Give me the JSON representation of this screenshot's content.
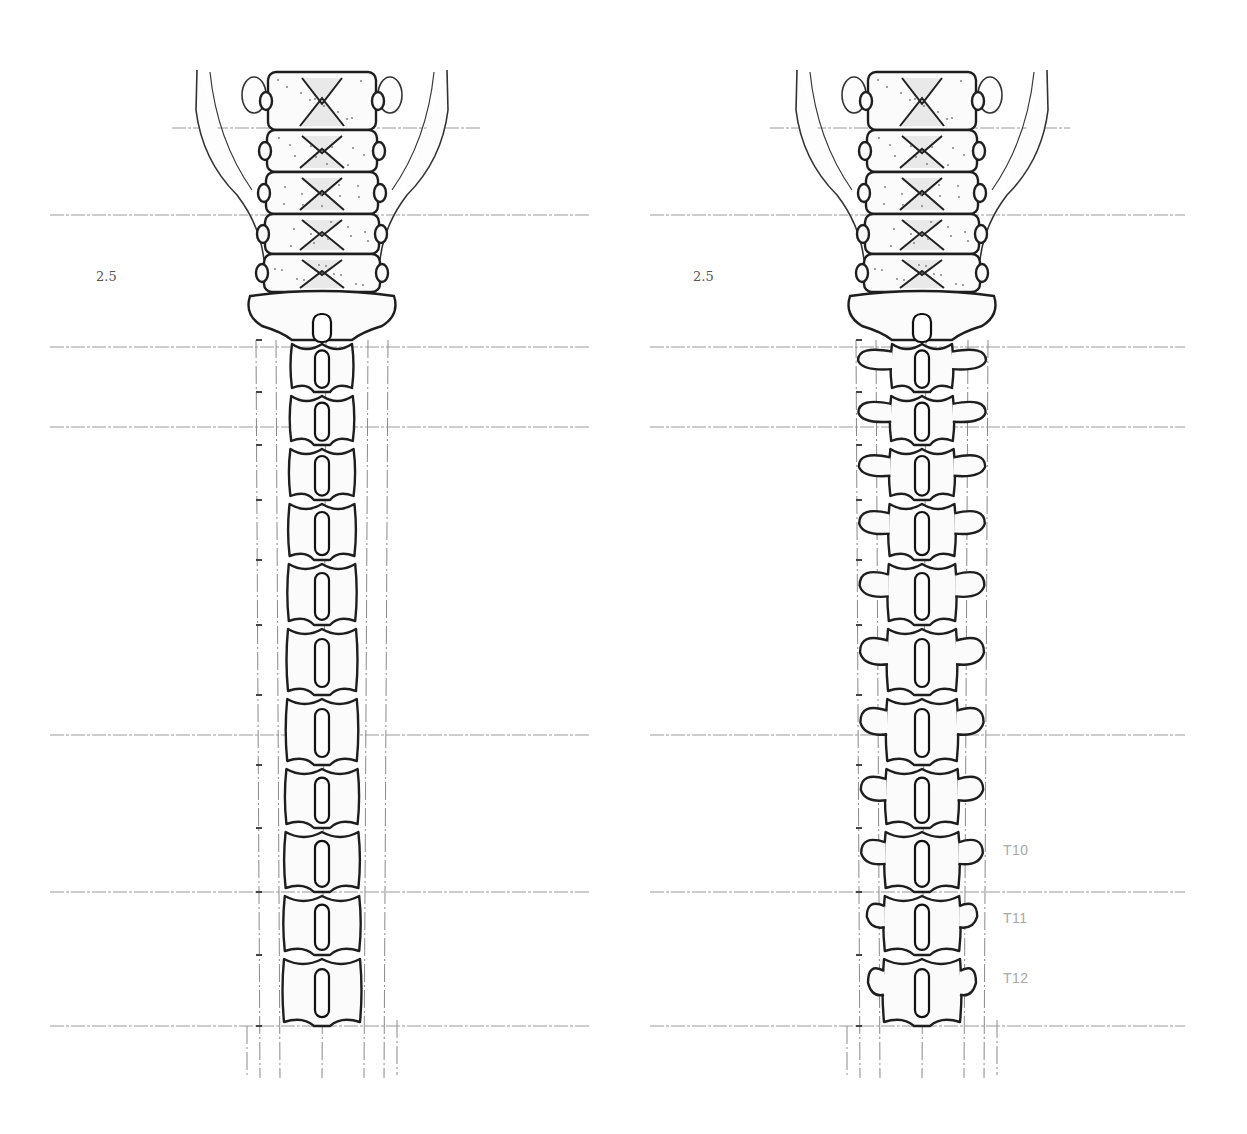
{
  "figure": {
    "panels": [
      {
        "id": "left",
        "view": "posterior spine without ribs/transverse processes",
        "scale_label": "2.5",
        "center_x": 322
      },
      {
        "id": "right",
        "view": "posterior spine with transverse processes",
        "scale_label": "2.5",
        "center_x": 922,
        "level_labels": [
          "T10",
          "T11",
          "T12"
        ]
      }
    ],
    "gridlines_y": [
      128,
      215,
      347,
      427,
      735,
      892,
      1026
    ],
    "vertebra_levels_y": [
      340,
      392,
      445,
      500,
      560,
      625,
      695,
      765,
      828,
      892,
      955,
      1026
    ],
    "colors": {
      "ink": "#1e1e1e",
      "grid": "#9a9a9a",
      "label": "#a8a8a8",
      "background": "#ffffff"
    }
  }
}
